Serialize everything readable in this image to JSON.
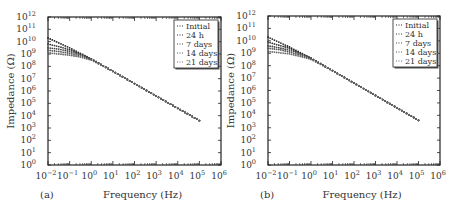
{
  "chart_data": [
    {
      "type": "scatter",
      "panel_label": "(a)",
      "title": "",
      "xlabel": "Frequency (Hz)",
      "ylabel": "Impedance (Ω)",
      "xscale": "log",
      "yscale": "log",
      "xlim_exp": [
        -2,
        6
      ],
      "ylim_exp": [
        0,
        12
      ],
      "x_tick_labels": [
        "10^-2",
        "10^-1",
        "10^0",
        "10^1",
        "10^2",
        "10^3",
        "10^4",
        "10^5",
        "10^6"
      ],
      "y_tick_labels": [
        "10^0",
        "10^1",
        "10^2",
        "10^3",
        "10^4",
        "10^5",
        "10^6",
        "10^7",
        "10^8",
        "10^9",
        "10^10",
        "10^11",
        "10^12"
      ],
      "grid": false,
      "legend_position": "upper right",
      "x_exp": [
        -2,
        -1.5,
        -1,
        -0.5,
        0,
        1,
        2,
        3,
        4,
        5
      ],
      "series": [
        {
          "name": "Initial",
          "log_values": [
            10.3,
            9.9,
            9.5,
            9.05,
            8.6,
            7.6,
            6.6,
            5.6,
            4.6,
            3.6
          ]
        },
        {
          "name": "24 h",
          "log_values": [
            9.8,
            9.6,
            9.35,
            9.0,
            8.6,
            7.6,
            6.6,
            5.6,
            4.6,
            3.6
          ]
        },
        {
          "name": "7 days",
          "log_values": [
            9.5,
            9.4,
            9.2,
            8.95,
            8.6,
            7.6,
            6.6,
            5.6,
            4.6,
            3.6
          ]
        },
        {
          "name": "14 days",
          "log_values": [
            9.3,
            9.2,
            9.05,
            8.85,
            8.55,
            7.6,
            6.6,
            5.6,
            4.6,
            3.6
          ]
        },
        {
          "name": "21 days",
          "log_values": [
            9.1,
            9.0,
            8.9,
            8.75,
            8.5,
            7.6,
            6.6,
            5.6,
            4.6,
            3.6
          ]
        }
      ]
    },
    {
      "type": "scatter",
      "panel_label": "(b)",
      "title": "",
      "xlabel": "Frequency (Hz)",
      "ylabel": "Impedance (Ω)",
      "xscale": "log",
      "yscale": "log",
      "xlim_exp": [
        -2,
        6
      ],
      "ylim_exp": [
        0,
        12
      ],
      "x_tick_labels": [
        "10^-2",
        "10^-1",
        "10^0",
        "10^1",
        "10^2",
        "10^3",
        "10^4",
        "10^5",
        "10^6"
      ],
      "y_tick_labels": [
        "10^0",
        "10^1",
        "10^2",
        "10^3",
        "10^4",
        "10^5",
        "10^6",
        "10^7",
        "10^8",
        "10^9",
        "10^10",
        "10^11",
        "10^12"
      ],
      "grid": false,
      "legend_position": "upper right",
      "x_exp": [
        -2,
        -1.5,
        -1,
        -0.5,
        0,
        1,
        2,
        3,
        4,
        5
      ],
      "series": [
        {
          "name": "Initial",
          "log_values": [
            10.3,
            9.9,
            9.5,
            9.05,
            8.6,
            7.6,
            6.6,
            5.6,
            4.6,
            3.6
          ]
        },
        {
          "name": "24 h",
          "log_values": [
            9.9,
            9.65,
            9.4,
            9.0,
            8.6,
            7.6,
            6.6,
            5.6,
            4.6,
            3.6
          ]
        },
        {
          "name": "7 days",
          "log_values": [
            9.6,
            9.45,
            9.25,
            8.95,
            8.6,
            7.6,
            6.6,
            5.6,
            4.6,
            3.6
          ]
        },
        {
          "name": "14 days",
          "log_values": [
            9.4,
            9.3,
            9.1,
            8.85,
            8.55,
            7.6,
            6.6,
            5.6,
            4.6,
            3.6
          ]
        },
        {
          "name": "21 days",
          "log_values": [
            9.15,
            9.05,
            8.95,
            8.75,
            8.5,
            7.6,
            6.6,
            5.6,
            4.6,
            3.6
          ]
        }
      ]
    }
  ]
}
